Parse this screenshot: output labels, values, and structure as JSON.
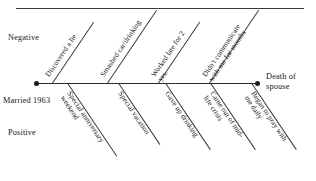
{
  "diagram": {
    "type": "fishbone",
    "title_rule": "horizontal-rule",
    "spine": {
      "start_label": "Married 1963",
      "end_label": "Death of spouse",
      "upper_axis_label": "Negative",
      "lower_axis_label": "Positive"
    },
    "negative_causes": [
      {
        "id": "neg-1",
        "label": "Discovered a lie"
      },
      {
        "id": "neg-2",
        "label": "Smashed car/drinking"
      },
      {
        "id": "neg-3",
        "label": "Worked late for 2 yrs."
      },
      {
        "id": "neg-4",
        "label": "Didn't communicate with me for months"
      }
    ],
    "positive_causes": [
      {
        "id": "pos-1",
        "label": "Special anniversary weekend"
      },
      {
        "id": "pos-2",
        "label": "Special vacation"
      },
      {
        "id": "pos-3",
        "label": "Gave up drinking"
      },
      {
        "id": "pos-4",
        "label": "Came out of mid-life crisis"
      },
      {
        "id": "pos-5",
        "label": "Began to pray with me daily"
      }
    ],
    "colors": {
      "line": "#3b3b3b",
      "spine": "#2b2b2b",
      "text": "#111111",
      "background": "#ffffff"
    }
  }
}
